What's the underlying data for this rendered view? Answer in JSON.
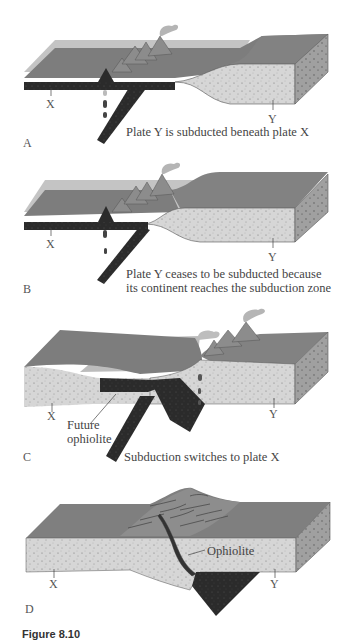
{
  "figure": {
    "caption_number": "Figure 8.10",
    "panels": [
      {
        "id": "A",
        "letter": "A",
        "caption": "Plate Y is subducted beneath plate X",
        "plate_labels": {
          "x": "X",
          "y": "Y"
        }
      },
      {
        "id": "B",
        "letter": "B",
        "caption_line1": "Plate Y ceases to be subducted because",
        "caption_line2": "its continent reaches the subduction zone",
        "plate_labels": {
          "x": "X",
          "y": "Y"
        }
      },
      {
        "id": "C",
        "letter": "C",
        "caption": "Subduction switches to plate X",
        "annotation_line1": "Future",
        "annotation_line2": "ophiolite",
        "plate_labels": {
          "x": "X",
          "y": "Y"
        }
      },
      {
        "id": "D",
        "letter": "D",
        "annotation": "Ophiolite",
        "plate_labels": {
          "x": "X",
          "y": "Y"
        }
      }
    ]
  },
  "colors": {
    "ocean_surface": "#7a7a7a",
    "water_tint": "#b8b8b8",
    "continental_crust": "#d9d9d9",
    "oceanic_crust": "#2a2a2a",
    "block_side": "#9a9a9a",
    "volcano": "#8c8c8c"
  }
}
